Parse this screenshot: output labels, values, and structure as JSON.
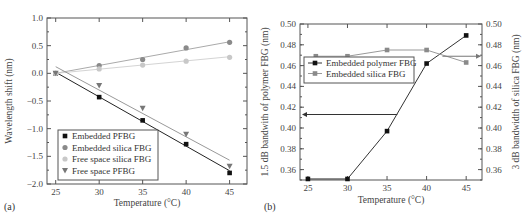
{
  "chart_data": [
    {
      "panel": "(a)",
      "type": "scatter",
      "xlabel": "Temperature (°C)",
      "ylabel": "Wavelength shift (nm)",
      "xlim": [
        24,
        47
      ],
      "ylim": [
        -2.0,
        1.0
      ],
      "xticks": [
        "25",
        "30",
        "35",
        "40",
        "45"
      ],
      "yticks": [
        "1.0",
        "0.5",
        "0.0",
        "−0.5",
        "−1.0",
        "−1.5",
        "−2.0"
      ],
      "grid": false,
      "legend_position": "lower left",
      "x": [
        25,
        30,
        35,
        40,
        45
      ],
      "series": [
        {
          "name": "Embedded PFBG",
          "marker": "square",
          "color": "#111111",
          "values": [
            0.0,
            -0.43,
            -0.85,
            -1.28,
            -1.8
          ],
          "fit_line": [
            0.02,
            -1.76
          ]
        },
        {
          "name": "Embedded silica FBG",
          "marker": "circle",
          "color": "#8a8a8a",
          "values": [
            0.0,
            0.14,
            0.25,
            0.46,
            0.56
          ],
          "fit_line": [
            0.0,
            0.57
          ]
        },
        {
          "name": "Free space silica FBG",
          "marker": "circle",
          "color": "#c8c8c8",
          "values": [
            0.0,
            0.08,
            0.15,
            0.22,
            0.29
          ],
          "fit_line": [
            0.0,
            0.3
          ]
        },
        {
          "name": "Free space PFBG",
          "marker": "triangle-down",
          "color": "#777777",
          "values": [
            0.0,
            -0.22,
            -0.63,
            -1.1,
            -1.68
          ],
          "fit_line": [
            0.12,
            -1.57
          ]
        }
      ]
    },
    {
      "panel": "(b)",
      "type": "line",
      "xlabel": "Temperature (°C)",
      "ylabel_left": "1.5 dB bandwith of polymer FBG (nm)",
      "ylabel_right": "3 dB bandwidth of silica FBG (nm)",
      "xlim": [
        24,
        47
      ],
      "ylim_left": [
        0.35,
        0.5
      ],
      "ylim_right": [
        0.35,
        0.5
      ],
      "xticks": [
        "25",
        "30",
        "35",
        "40",
        "45"
      ],
      "yticks_left": [
        "0.50",
        "0.48",
        "0.46",
        "0.44",
        "0.42",
        "0.40",
        "0.38",
        "0.36"
      ],
      "yticks_right": [
        "0.50",
        "0.48",
        "0.46",
        "0.44",
        "0.42",
        "0.40",
        "0.38",
        "0.36"
      ],
      "grid": false,
      "legend_position": "upper left",
      "annotations": [
        "arrow pointing left toward left axis at y≈0.413",
        "arrow pointing right toward right axis at y≈0.469"
      ],
      "x": [
        25,
        30,
        35,
        40,
        45
      ],
      "series": [
        {
          "name": "Embedded polymer FBG",
          "axis": "left",
          "marker": "square",
          "color": "#111111",
          "values": [
            0.351,
            0.351,
            0.397,
            0.462,
            0.489
          ]
        },
        {
          "name": "Embedded silica FBG",
          "axis": "right",
          "marker": "square",
          "color": "#8a8a8a",
          "x": [
            26,
            30,
            35,
            40,
            45
          ],
          "values": [
            0.469,
            0.469,
            0.475,
            0.475,
            0.463
          ]
        }
      ]
    }
  ]
}
